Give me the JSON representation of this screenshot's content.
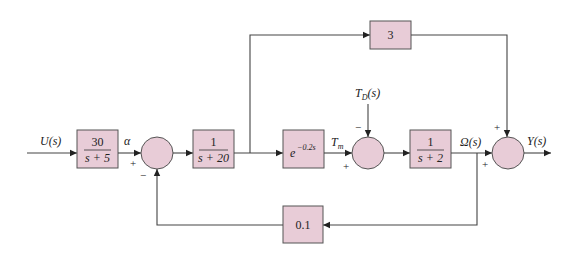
{
  "diagram": {
    "type": "block-diagram",
    "colors": {
      "block_fill": "#e8ccd7",
      "line": "#444444",
      "background": "#ffffff"
    },
    "signals": {
      "input": "U(s)",
      "alpha": "α",
      "tm": "T",
      "tm_sub": "m",
      "disturbance": "T",
      "disturbance_sub": "D",
      "disturbance_tail": "(s)",
      "omega": "Ω(s)",
      "output": "Y(s)"
    },
    "blocks": {
      "b1": {
        "num": "30",
        "den": "s + 5"
      },
      "b2": {
        "num": "1",
        "den": "s + 20"
      },
      "delay": {
        "base": "e",
        "exp": "−0.2s"
      },
      "b3": {
        "num": "1",
        "den": "s + 2"
      },
      "feedforward": {
        "value": "3"
      },
      "feedback": {
        "value": "0.1"
      }
    },
    "summing_junctions": {
      "s1": {
        "top": "",
        "left": "+",
        "bottom": "−"
      },
      "s2": {
        "top": "−",
        "left": "+"
      },
      "s3": {
        "top": "+",
        "left": "+"
      }
    }
  }
}
